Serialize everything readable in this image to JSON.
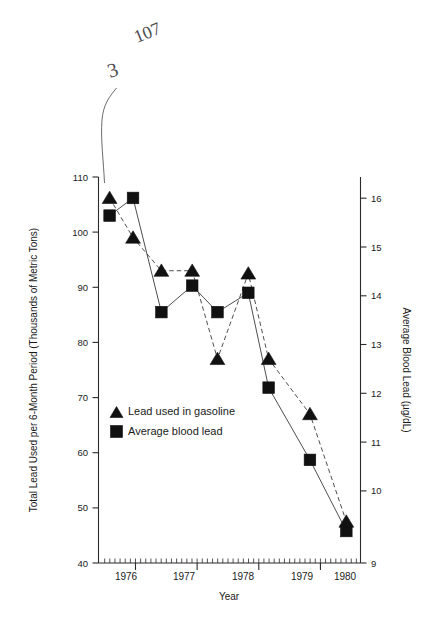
{
  "chart_data": {
    "type": "line",
    "title": "",
    "xlabel": "Year",
    "ylabel": "Total Lead Used per 6-Month Period (Thousands of Metric Tons)",
    "y2label": "Average Blood Lead (µg/dL)",
    "x_tick_labels": [
      "1976",
      "1977",
      "1978",
      "1979",
      "1980"
    ],
    "xlim": [
      1975.9,
      1980.15
    ],
    "ylim": [
      40,
      110
    ],
    "y_ticks": [
      40,
      50,
      60,
      70,
      80,
      90,
      100,
      110
    ],
    "y2lim": [
      9,
      16.92
    ],
    "y2_ticks": [
      9,
      10,
      11,
      12,
      13,
      14,
      15,
      16
    ],
    "grid": false,
    "legend_position": "center-left",
    "x": [
      1976.08,
      1976.46,
      1976.92,
      1977.42,
      1977.83,
      1978.33,
      1978.66,
      1979.33,
      1979.92
    ],
    "series": [
      {
        "name": "Lead used in gasoline",
        "marker": "triangle",
        "linestyle": "dashed",
        "axis": "left",
        "values": [
          106.2,
          99.0,
          93.0,
          93.0,
          77.0,
          92.5,
          77.0,
          67.0,
          47.5
        ]
      },
      {
        "name": "Average blood lead",
        "marker": "square",
        "linestyle": "solid",
        "axis": "right",
        "values_left_scale": [
          103.0,
          106.2,
          85.5,
          90.3,
          85.5,
          89.0,
          71.8,
          58.7,
          45.8
        ],
        "values": [
          15.84,
          16.16,
          14.05,
          14.53,
          14.05,
          14.4,
          12.68,
          11.37,
          10.11
        ]
      }
    ],
    "annotations": [
      {
        "name": "handwritten-107",
        "text": "107",
        "x": 137,
        "y": 43,
        "rotate": -22,
        "size": 18
      },
      {
        "name": "handwritten-3",
        "text": "3",
        "x": 110,
        "y": 78,
        "rotate": -18,
        "size": 20
      }
    ]
  },
  "legend": {
    "items": [
      {
        "label": "Lead used in gasoline",
        "marker": "triangle-icon"
      },
      {
        "label": "Average blood lead",
        "marker": "square-icon"
      }
    ]
  }
}
